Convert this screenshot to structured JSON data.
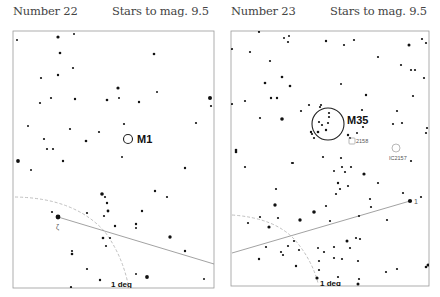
{
  "panels": [
    {
      "number_label": "Number 22",
      "mag_label": "Stars to mag. 9.5",
      "frame": {
        "x": 13,
        "y": 31,
        "w": 201,
        "h": 257
      },
      "objects": [
        {
          "type": "circle",
          "name": "M1",
          "cx": 128,
          "cy": 139,
          "r": 4.5,
          "label": "M1",
          "lx": 137,
          "ly": 143,
          "size": 11
        }
      ],
      "scale_label": "1 deg",
      "scale_pos": {
        "x": 111,
        "y": 287
      },
      "star_label": "ζ",
      "star_label_pos": {
        "x": 56,
        "y": 229
      },
      "line": {
        "x1": 58,
        "y1": 217,
        "x2": 214,
        "y2": 264
      },
      "arc": "M15,197 Q75,198 105,232 Q122,255 128,284",
      "stars": [
        [
          17,
          40,
          1
        ],
        [
          58,
          37,
          1.6
        ],
        [
          74,
          34,
          1
        ],
        [
          60,
          53,
          1.3
        ],
        [
          154,
          54,
          1.3
        ],
        [
          73,
          68,
          1.1
        ],
        [
          41,
          78,
          1.1
        ],
        [
          58,
          75,
          1.2
        ],
        [
          118,
          88,
          1.6
        ],
        [
          157,
          92,
          1
        ],
        [
          51,
          98,
          1.1
        ],
        [
          75,
          99,
          1.2
        ],
        [
          40,
          103,
          1.1
        ],
        [
          107,
          100,
          1.3
        ],
        [
          119,
          98,
          1
        ],
        [
          139,
          102,
          1.2
        ],
        [
          210,
          98,
          2
        ],
        [
          211,
          106,
          1.1
        ],
        [
          28,
          126,
          1
        ],
        [
          70,
          129,
          1.1
        ],
        [
          99,
          132,
          1.1
        ],
        [
          124,
          124,
          1.1
        ],
        [
          196,
          123,
          1.1
        ],
        [
          44,
          139,
          1.1
        ],
        [
          86,
          141,
          1.3
        ],
        [
          47,
          149,
          1.1
        ],
        [
          53,
          149,
          1.1
        ],
        [
          122,
          157,
          1
        ],
        [
          18,
          161,
          1.9
        ],
        [
          63,
          161,
          1.2
        ],
        [
          185,
          168,
          1.2
        ],
        [
          31,
          170,
          1
        ],
        [
          155,
          191,
          1.2
        ],
        [
          102,
          194,
          1.8
        ],
        [
          167,
          197,
          1.1
        ],
        [
          105,
          197,
          1.1
        ],
        [
          107,
          203,
          1.2
        ],
        [
          108,
          211,
          1.4
        ],
        [
          52,
          212,
          1.1
        ],
        [
          87,
          213,
          1.1
        ],
        [
          142,
          211,
          1.2
        ],
        [
          104,
          216,
          1.1
        ],
        [
          58,
          217,
          2.4
        ],
        [
          115,
          226,
          1.2
        ],
        [
          136,
          224,
          1.2
        ],
        [
          136,
          228,
          1
        ],
        [
          170,
          237,
          1.7
        ],
        [
          103,
          238,
          1.3
        ],
        [
          110,
          238,
          1.1
        ],
        [
          106,
          246,
          1.1
        ],
        [
          72,
          251,
          1.1
        ],
        [
          72,
          254,
          1.3
        ],
        [
          185,
          251,
          1.2
        ],
        [
          87,
          269,
          1.1
        ],
        [
          136,
          274,
          1
        ],
        [
          147,
          277,
          1.9
        ],
        [
          100,
          280,
          1.2
        ],
        [
          204,
          279,
          1
        ],
        [
          71,
          287,
          1.1
        ]
      ]
    },
    {
      "number_label": "Number 23",
      "mag_label": "Stars to mag. 9.5",
      "frame": {
        "x": 231,
        "y": 31,
        "w": 198,
        "h": 255
      },
      "objects": [
        {
          "type": "circle",
          "name": "M35",
          "cx": 328,
          "cy": 124,
          "r": 16,
          "label": "M35",
          "lx": 347,
          "ly": 124,
          "size": 11
        },
        {
          "type": "square",
          "name": "NGC 2158",
          "cx": 352,
          "cy": 141,
          "r": 3,
          "label": "2158",
          "lx": 356,
          "ly": 143,
          "size": 5.5
        },
        {
          "type": "circle",
          "name": "IC2157",
          "cx": 396,
          "cy": 148,
          "r": 4,
          "label": "IC2157",
          "lx": 389,
          "ly": 160,
          "size": 5.5
        }
      ],
      "scale_label": "1 deg",
      "scale_pos": {
        "x": 320,
        "y": 286
      },
      "star_label": "1",
      "star_label_pos": {
        "x": 414,
        "y": 204
      },
      "line": {
        "x1": 232,
        "y1": 253,
        "x2": 410,
        "y2": 201
      },
      "arc": "M232,215 Q275,218 295,240 Q312,260 318,283",
      "stars": [
        [
          259,
          32,
          1.1
        ],
        [
          284,
          38,
          1
        ],
        [
          289,
          36,
          1
        ],
        [
          288,
          42,
          1.1
        ],
        [
          326,
          41,
          1.2
        ],
        [
          344,
          45,
          1.1
        ],
        [
          354,
          40,
          1.1
        ],
        [
          409,
          45,
          1.5
        ],
        [
          422,
          39,
          1.1
        ],
        [
          426,
          43,
          1.1
        ],
        [
          232,
          49,
          1.1
        ],
        [
          250,
          52,
          1.1
        ],
        [
          378,
          57,
          1.1
        ],
        [
          270,
          61,
          1.1
        ],
        [
          401,
          65,
          1.1
        ],
        [
          411,
          70,
          1.1
        ],
        [
          415,
          70,
          1.1
        ],
        [
          424,
          78,
          1.1
        ],
        [
          282,
          77,
          1.3
        ],
        [
          265,
          83,
          1.3
        ],
        [
          290,
          86,
          1.3
        ],
        [
          341,
          84,
          1
        ],
        [
          366,
          95,
          1.2
        ],
        [
          413,
          96,
          1.1
        ],
        [
          271,
          98,
          1.2
        ],
        [
          277,
          98,
          1.2
        ],
        [
          232,
          104,
          1.1
        ],
        [
          245,
          101,
          1.1
        ],
        [
          309,
          105,
          1.1
        ],
        [
          321,
          105,
          1.1
        ],
        [
          320,
          107,
          1.1
        ],
        [
          362,
          110,
          1.1
        ],
        [
          397,
          111,
          1.1
        ],
        [
          301,
          111,
          1.1
        ],
        [
          260,
          118,
          1.1
        ],
        [
          282,
          119,
          1.8
        ],
        [
          329,
          113,
          1.1
        ],
        [
          329,
          117,
          1.1
        ],
        [
          328,
          123,
          1.1
        ],
        [
          319,
          122,
          1.1
        ],
        [
          322,
          125,
          1.1
        ],
        [
          318,
          132,
          1.3
        ],
        [
          326,
          130,
          1.2
        ],
        [
          311,
          132,
          1.2
        ],
        [
          312,
          134,
          1.1
        ],
        [
          314,
          138,
          1.1
        ],
        [
          393,
          124,
          1.1
        ],
        [
          402,
          123,
          1.1
        ],
        [
          363,
          127,
          1.1
        ],
        [
          427,
          128,
          1.1
        ],
        [
          426,
          133,
          1.1
        ],
        [
          348,
          135,
          1.2
        ],
        [
          350,
          138,
          1.1
        ],
        [
          357,
          133,
          1
        ],
        [
          236,
          150,
          1.3
        ],
        [
          236,
          152,
          1.3
        ],
        [
          323,
          157,
          1.1
        ],
        [
          341,
          158,
          1.1
        ],
        [
          292,
          163,
          1.1
        ],
        [
          411,
          161,
          1.1
        ],
        [
          245,
          167,
          1.1
        ],
        [
          293,
          163,
          1
        ],
        [
          342,
          167,
          1.1
        ],
        [
          351,
          167,
          1.1
        ],
        [
          334,
          171,
          1
        ],
        [
          345,
          172,
          1.1
        ],
        [
          364,
          174,
          1.6
        ],
        [
          338,
          183,
          1.2
        ],
        [
          348,
          186,
          1.1
        ],
        [
          378,
          183,
          1.1
        ],
        [
          276,
          189,
          1.1
        ],
        [
          340,
          189,
          1.1
        ],
        [
          336,
          194,
          1.1
        ],
        [
          403,
          193,
          1.1
        ],
        [
          421,
          197,
          1.1
        ],
        [
          370,
          199,
          1.1
        ],
        [
          410,
          201,
          2.1
        ],
        [
          275,
          205,
          1.7
        ],
        [
          326,
          206,
          1.1
        ],
        [
          371,
          207,
          1.1
        ],
        [
          314,
          212,
          1.8
        ],
        [
          260,
          217,
          1.1
        ],
        [
          278,
          218,
          1.1
        ],
        [
          248,
          223,
          1.1
        ],
        [
          300,
          220,
          1.7
        ],
        [
          330,
          221,
          1.1
        ],
        [
          359,
          216,
          1.1
        ],
        [
          387,
          220,
          1.1
        ],
        [
          269,
          227,
          1.6
        ],
        [
          347,
          241,
          1.5
        ],
        [
          356,
          238,
          1.1
        ],
        [
          360,
          239,
          1.1
        ],
        [
          294,
          241,
          1.1
        ],
        [
          266,
          247,
          1.1
        ],
        [
          288,
          246,
          1.1
        ],
        [
          318,
          248,
          1
        ],
        [
          299,
          250,
          1.1
        ],
        [
          334,
          247,
          1.1
        ],
        [
          350,
          248,
          1.1
        ],
        [
          324,
          252,
          1.1
        ],
        [
          281,
          252,
          1.1
        ],
        [
          283,
          255,
          1.1
        ],
        [
          259,
          259,
          1.2
        ],
        [
          334,
          258,
          1.1
        ],
        [
          342,
          259,
          1.1
        ],
        [
          319,
          261,
          1.1
        ],
        [
          358,
          261,
          1.1
        ],
        [
          397,
          269,
          1.1
        ],
        [
          386,
          272,
          1.1
        ],
        [
          428,
          265,
          1.5
        ],
        [
          426,
          267,
          1.3
        ],
        [
          296,
          266,
          1.2
        ],
        [
          319,
          270,
          1.1
        ],
        [
          317,
          278,
          1.6
        ],
        [
          359,
          279,
          1.1
        ],
        [
          338,
          277,
          1.1
        ],
        [
          358,
          284,
          1.5
        ],
        [
          339,
          286,
          1.1
        ]
      ]
    }
  ]
}
